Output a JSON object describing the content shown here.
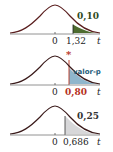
{
  "panels": [
    {
      "id": "panel-1",
      "zero_label": "0",
      "critical_label": "1,32",
      "axis_label": "t",
      "area_label": "0,10",
      "fill_color": "#4e6b2e",
      "critical_color": "#222222",
      "area_label_color": "#2f4a1e"
    },
    {
      "id": "panel-2",
      "zero_label": "0",
      "critical_label": "0,80",
      "axis_label": "t",
      "area_label": "valor-p",
      "marker": "*",
      "fill_color": "#8fb6cc",
      "critical_color": "#b5321e",
      "area_label_color": "#1f5d7a"
    },
    {
      "id": "panel-3",
      "zero_label": "0",
      "critical_label": "0,686",
      "axis_label": "t",
      "area_label": "0,25",
      "fill_color": "#d7d7d9",
      "critical_color": "#222222",
      "area_label_color": "#333333"
    }
  ]
}
